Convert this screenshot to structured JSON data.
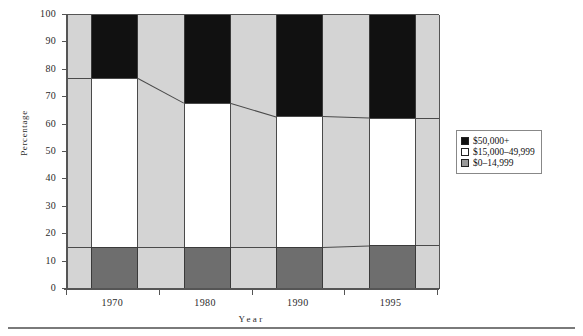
{
  "chart_data": {
    "type": "bar",
    "stacked": true,
    "title": "",
    "xlabel": "Year",
    "ylabel": "Percentage",
    "categories": [
      "1970",
      "1980",
      "1990",
      "1995"
    ],
    "ylim": [
      0,
      100
    ],
    "yticks": [
      "100",
      "90",
      "80",
      "70",
      "60",
      "50",
      "40",
      "30",
      "20",
      "10",
      "0"
    ],
    "grid": false,
    "legend_position": "right",
    "series": [
      {
        "name": "$0–14,999",
        "color": "#6e6e6e",
        "values": [
          15.5,
          15.5,
          15.5,
          16
        ]
      },
      {
        "name": "$15,000–49,999",
        "color": "#ffffff",
        "values": [
          61.5,
          52.5,
          47.5,
          46.5
        ]
      },
      {
        "name": "$50,000+",
        "color": "#111111",
        "values": [
          23,
          32,
          37,
          37.5
        ]
      }
    ],
    "cumulative_tops": [
      {
        "year": "1970",
        "low": 15.5,
        "mid_top": 77,
        "total": 100
      },
      {
        "year": "1980",
        "low": 15.5,
        "mid_top": 68,
        "total": 100
      },
      {
        "year": "1990",
        "low": 15.5,
        "mid_top": 63,
        "total": 100
      },
      {
        "year": "1995",
        "low": 16,
        "mid_top": 62.5,
        "total": 100
      }
    ]
  },
  "legend": {
    "items": [
      {
        "label": "$50,000+",
        "swatch": "black"
      },
      {
        "label": "$15,000–49,999",
        "swatch": "white"
      },
      {
        "label": "$0–14,999",
        "swatch": "gray"
      }
    ]
  },
  "axes": {
    "y_title": "Percentage",
    "x_title": "Year"
  }
}
